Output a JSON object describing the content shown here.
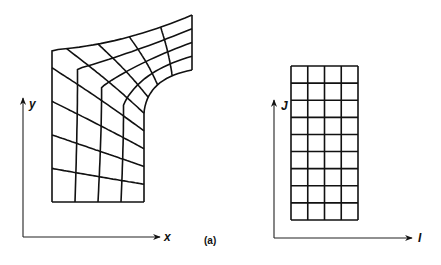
{
  "figure": {
    "caption": "(a)",
    "physical_domain": {
      "x_axis_label": "x",
      "y_axis_label": "y",
      "grid_description": "curvilinear body-fitted mesh",
      "cells_i": 4,
      "cells_j": 9
    },
    "computational_domain": {
      "i_axis_label": "I",
      "j_axis_label": "J",
      "grid_description": "uniform rectangular mesh",
      "cells_i": 4,
      "cells_j": 9
    }
  }
}
